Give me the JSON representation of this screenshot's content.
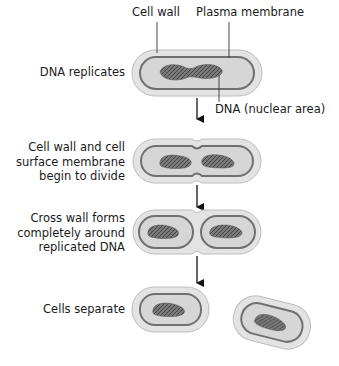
{
  "labels": {
    "cell_wall": "Cell wall",
    "plasma_membrane": "Plasma membrane",
    "dna_nuclear_area": "DNA (nuclear area)"
  },
  "steps": [
    {
      "label_lines": [
        "DNA replicates"
      ]
    },
    {
      "label_lines": [
        "Cell wall and cell",
        "surface membrane",
        "begin to divide"
      ]
    },
    {
      "label_lines": [
        "Cross wall forms",
        "completely around",
        "replicated DNA"
      ]
    },
    {
      "label_lines": [
        "Cells separate"
      ]
    }
  ],
  "colors": {
    "cell_wall_fill": "#e3e3e3",
    "cell_wall_stroke": "#bdbdbd",
    "cytoplasm_fill": "#d6d6d6",
    "membrane_stroke": "#707070",
    "dna_fill": "#6e6e6e",
    "arrow": "#111111"
  }
}
